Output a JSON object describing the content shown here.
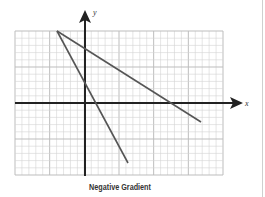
{
  "caption": "Negative Gradient",
  "axes": {
    "x_label": "x",
    "y_label": "y"
  },
  "colors": {
    "grid_minor": "#d4d4d4",
    "grid_major": "#bdbdbd",
    "axis": "#222222",
    "line": "#555555"
  },
  "chart_data": {
    "type": "line",
    "title": "Negative Gradient",
    "xlabel": "x",
    "ylabel": "y",
    "grid": true,
    "xlim": [
      -10,
      20
    ],
    "ylim": [
      -10,
      10
    ],
    "series": [
      {
        "name": "line-1 (shallow)",
        "points": [
          [
            -4,
            10
          ],
          [
            0,
            7.5
          ],
          [
            12,
            0
          ],
          [
            16.5,
            -2.6
          ]
        ]
      },
      {
        "name": "line-2 (steep)",
        "points": [
          [
            -4,
            10
          ],
          [
            0,
            2.6
          ],
          [
            1.4,
            0
          ],
          [
            6.1,
            -8.3
          ]
        ]
      }
    ]
  }
}
